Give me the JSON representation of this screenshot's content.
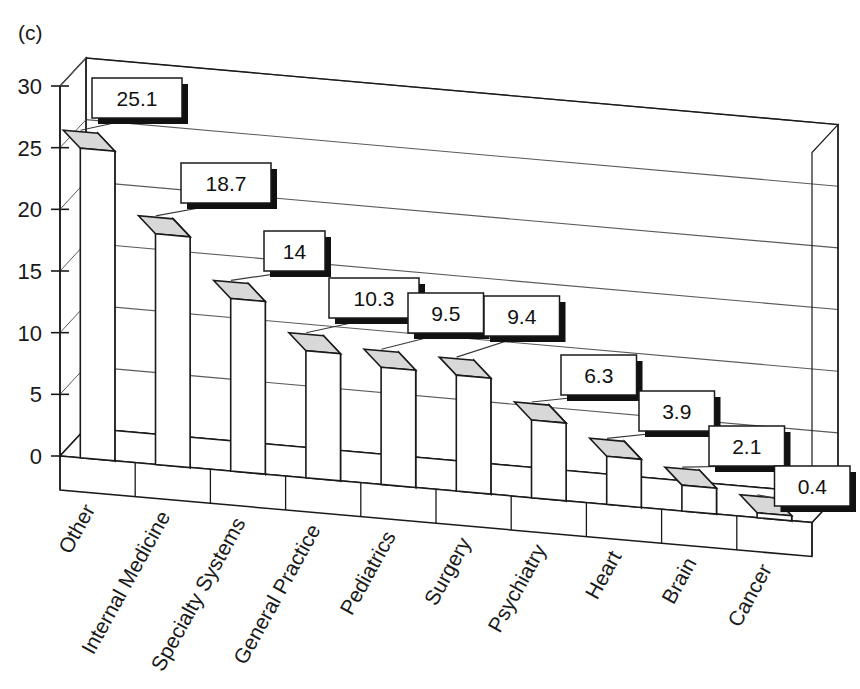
{
  "figure": {
    "panel_label": "(c)"
  },
  "chart_data": {
    "type": "bar",
    "title": "(c)",
    "xlabel": "",
    "ylabel": "",
    "ylim": [
      0,
      30
    ],
    "yticks": [
      0,
      5,
      10,
      15,
      20,
      25,
      30
    ],
    "ytick_labels": [
      "0",
      "5",
      "10",
      "15",
      "20",
      "25",
      "30"
    ],
    "grid": true,
    "legend": null,
    "style_3d": true,
    "categories": [
      "Other",
      "Internal Medicine",
      "Specialty Systems",
      "General Practice",
      "Pediatrics",
      "Surgery",
      "Psychiatry",
      "Heart",
      "Brain",
      "Cancer"
    ],
    "values": [
      25.1,
      18.7,
      14,
      10.3,
      9.5,
      9.4,
      6.3,
      3.9,
      2.1,
      0.4
    ],
    "value_labels": [
      "25.1",
      "18.7",
      "14",
      "10.3",
      "9.5",
      "9.4",
      "6.3",
      "3.9",
      "2.1",
      "0.4"
    ]
  },
  "colors": {
    "bar_front": "#ffffff",
    "bar_side": "#b9b9b9",
    "bar_top": "#d8d8d8",
    "outline": "#1a1a1a",
    "gridline": "#5a5a5a",
    "label_box_fill": "#ffffff",
    "label_box_shadow": "#111111",
    "text": "#1a1a1a",
    "background": "#ffffff"
  }
}
